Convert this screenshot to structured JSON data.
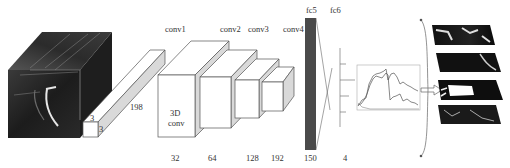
{
  "diagram": {
    "type": "3D CNN architecture",
    "input": {
      "name": "input-video-volume",
      "kernel": {
        "width": "3",
        "height": "3",
        "depth": "198"
      }
    },
    "layers": [
      {
        "name": "conv1",
        "inner_text_line1": "3D",
        "inner_text_line2": "conv",
        "size": "32"
      },
      {
        "name": "conv2",
        "size": "64"
      },
      {
        "name": "conv3",
        "size": "128"
      },
      {
        "name": "conv4",
        "size": "192"
      },
      {
        "name": "fc5",
        "size": "150"
      },
      {
        "name": "fc6",
        "size": "4"
      }
    ],
    "output": {
      "plot": "time-series-curves",
      "result_images_count": 4
    }
  },
  "colors": {
    "background": "#ffffff",
    "stroke": "#555555",
    "side_face": "#d9d9d9",
    "fc5_fill": "#4a4a4a",
    "text": "#333333"
  }
}
